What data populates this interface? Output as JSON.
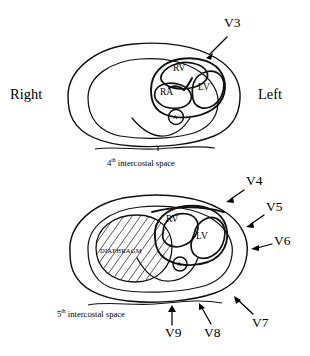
{
  "figure": {
    "orientation": {
      "right_label": "Right",
      "left_label": "Left"
    },
    "ink_color": "#111111",
    "background_color": "#ffffff"
  },
  "upper_panel": {
    "caption_prefix": "4",
    "caption_ordinal": "th",
    "caption_suffix": " intercostal space",
    "caption_full": "4th intercostal space",
    "chambers": [
      {
        "id": "rv",
        "label": "RV",
        "name": "right ventricle"
      },
      {
        "id": "ra",
        "label": "RA",
        "name": "right atrium"
      },
      {
        "id": "lv",
        "label": "LV",
        "name": "left ventricle"
      }
    ],
    "aorta_label": "A",
    "leads": [
      {
        "label": "V3"
      }
    ]
  },
  "lower_panel": {
    "caption_prefix": "5",
    "caption_ordinal": "th",
    "caption_suffix": " intercostal space",
    "caption_full": "5th intercostal space",
    "chambers": [
      {
        "id": "rv",
        "label": "RV",
        "name": "right ventricle"
      },
      {
        "id": "lv",
        "label": "LV",
        "name": "left ventricle"
      }
    ],
    "aorta_label": "A",
    "diaphragm_label": "DIAPHRAGM",
    "leads": [
      {
        "label": "V4"
      },
      {
        "label": "V5"
      },
      {
        "label": "V6"
      },
      {
        "label": "V7"
      },
      {
        "label": "V8"
      },
      {
        "label": "V9"
      }
    ]
  }
}
